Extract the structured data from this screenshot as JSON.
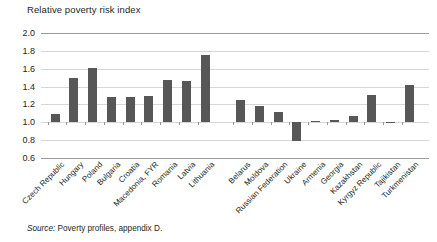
{
  "chart_data": {
    "type": "bar",
    "title": "Relative poverty risk index",
    "xlabel": "",
    "ylabel": "Relative poverty risk index",
    "ylim": [
      0.6,
      2.0
    ],
    "ytick_values": [
      2.0,
      1.8,
      1.6,
      1.4,
      1.2,
      1.0,
      0.8,
      0.6
    ],
    "ytick_labels": [
      "2.0",
      "1.8",
      "1.6",
      "1.4",
      "1.2",
      "1.0",
      "0.8",
      "0.6"
    ],
    "baseline": 1.0,
    "grid": true,
    "legend": "none",
    "bar_color": "#575757",
    "grid_color": "#d6d6d6",
    "group_gap_after_index": 7,
    "categories": [
      "Czech Republic",
      "Hungary",
      "Poland",
      "Bulgaria",
      "Croatia",
      "Macedonia, FYR",
      "Romania",
      "Latvia",
      "Lithuania",
      "Belarus",
      "Moldova",
      "Russian Federation",
      "Ukraine",
      "Armenia",
      "Georgia",
      "Kazakhstan",
      "Kyrgyz Republic",
      "Tajikistan",
      "Turkmenistan"
    ],
    "values": [
      1.09,
      1.5,
      1.61,
      1.28,
      1.28,
      1.3,
      1.47,
      1.46,
      1.75,
      1.25,
      1.18,
      1.11,
      0.79,
      1.01,
      1.03,
      1.07,
      1.31,
      1.0,
      1.42
    ]
  },
  "source": {
    "label": "Source:",
    "text": "Poverty profiles, appendix D."
  }
}
